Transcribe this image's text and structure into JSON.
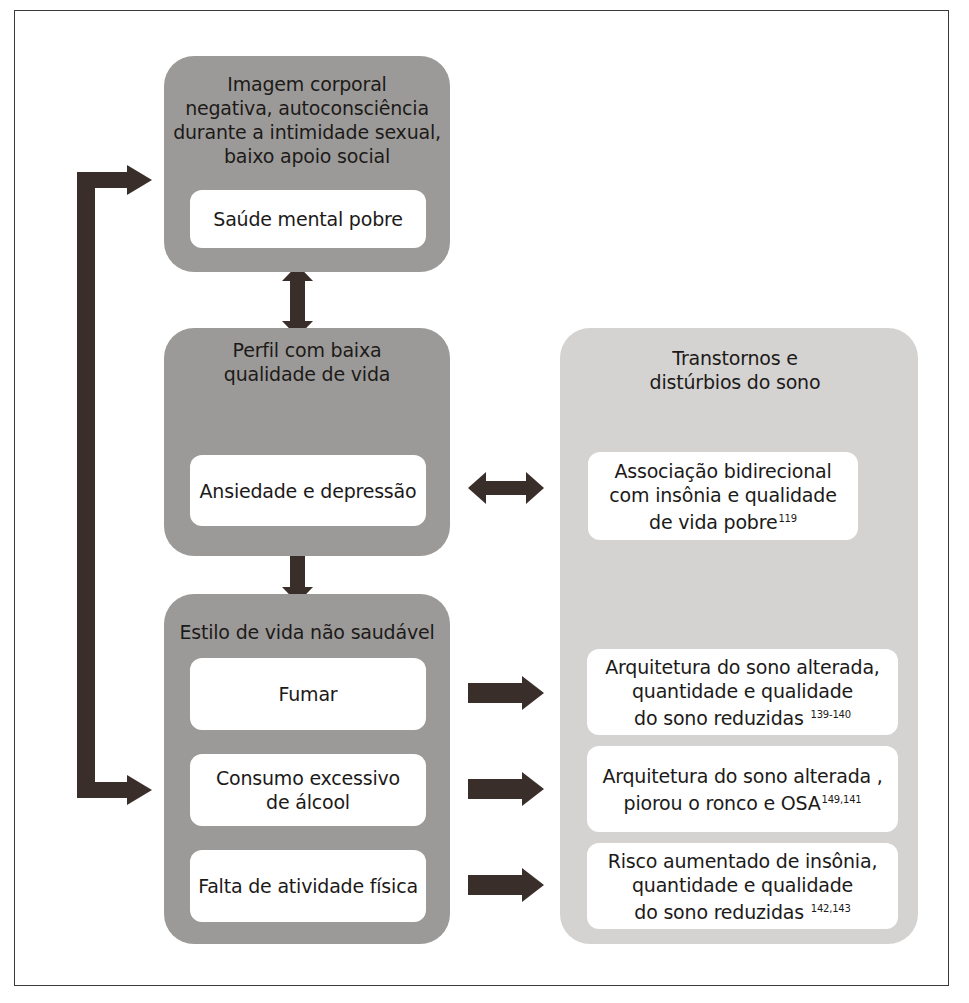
{
  "diagram": {
    "left_column": {
      "group_1": {
        "heading_lines": [
          "Imagem corporal",
          "negativa, autoconsciência",
          "durante a intimidade sexual,",
          "baixo apoio social"
        ],
        "card": "Saúde mental pobre"
      },
      "group_2": {
        "heading_lines": [
          "Perfil com baixa",
          "qualidade de vida"
        ],
        "card": "Ansiedade e depressão"
      },
      "group_3": {
        "heading": "Estilo de vida não saudável",
        "cards": [
          {
            "lines": [
              "Fumar"
            ]
          },
          {
            "lines": [
              "Consumo excessivo",
              "de álcool"
            ]
          },
          {
            "lines": [
              "Falta de atividade física"
            ]
          }
        ]
      }
    },
    "right_column": {
      "heading_lines": [
        "Transtornos e",
        "distúrbios do sono"
      ],
      "cards": [
        {
          "lines": [
            "Associação bidirecional",
            "com insônia e qualidade",
            "de vida pobre"
          ],
          "ref": "119"
        },
        {
          "lines": [
            "Arquitetura do sono alterada,",
            "quantidade e qualidade",
            "do sono reduzidas "
          ],
          "ref": "139-140"
        },
        {
          "lines": [
            "Arquitetura do sono alterada ,",
            "piorou o ronco e OSA"
          ],
          "ref": "149,141"
        },
        {
          "lines": [
            "Risco aumentado de insônia,",
            "quantidade e qualidade",
            "do sono reduzidas "
          ],
          "ref": "142,143"
        }
      ]
    },
    "connectors": [
      {
        "from": "group_1",
        "to": "group_2",
        "type": "bidirectional-vertical"
      },
      {
        "from": "group_2",
        "to": "group_3",
        "type": "bidirectional-vertical"
      },
      {
        "from": "group_3",
        "to": "group_1",
        "type": "bracket-bidirectional-left"
      },
      {
        "from": "ansiedade-e-depressao",
        "to": "right_card_1",
        "type": "bidirectional-horizontal"
      },
      {
        "from": "fumar",
        "to": "right_card_2",
        "type": "right"
      },
      {
        "from": "consumo-excessivo-de-alcool",
        "to": "right_card_3",
        "type": "right"
      },
      {
        "from": "falta-de-atividade-fisica",
        "to": "right_card_4",
        "type": "right"
      }
    ],
    "colors": {
      "group_dark": "#9c9a98",
      "group_light": "#d4d3d1",
      "card": "#ffffff",
      "arrow": "#3a2e2a",
      "text": "#1c1a19"
    }
  }
}
